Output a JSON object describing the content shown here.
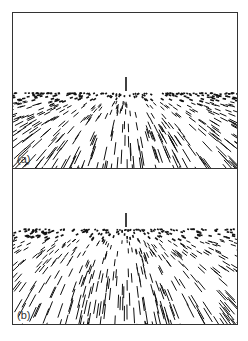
{
  "figure": {
    "panels": [
      {
        "id": "a",
        "label": "(a)",
        "description": "Perspective view of textured ground plane with line segments converging toward a horizon; vertical marker at center of horizon",
        "horizon_y": 78,
        "marker_x": 113
      },
      {
        "id": "b",
        "label": "(b)",
        "description": "Perspective view of textured ground plane with line segments, denser flow on left; vertical marker at center of horizon",
        "horizon_y": 58,
        "marker_x": 113
      }
    ],
    "colors": {
      "ink": "#111111",
      "frame": "#333333",
      "background": "#ffffff"
    }
  }
}
